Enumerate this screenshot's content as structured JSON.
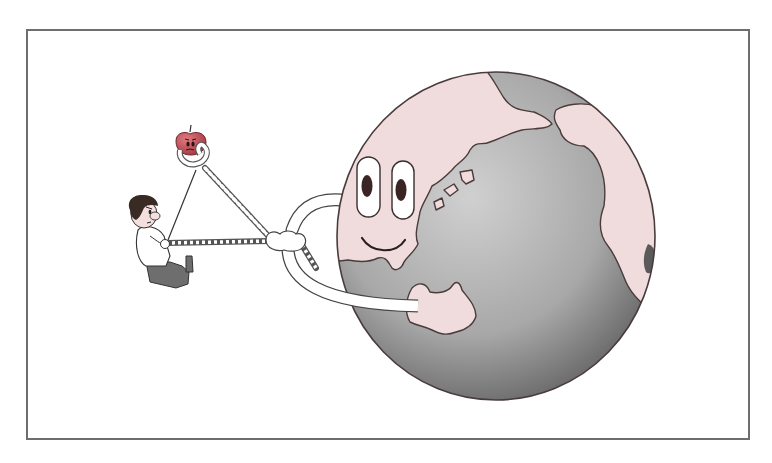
{
  "illustration": {
    "description": "Cartoon: a smiling Earth pulls a rope tied to an apple while a small boy pulls the other end",
    "characters": {
      "earth": {
        "expression": "smile",
        "pink_land": "#f0dcdc",
        "ocean_light": "#c4c4c4",
        "ocean_dark": "#7a7a7a",
        "outline": "#4a3c3c"
      },
      "boy": {
        "hair": "#3a2a24",
        "shirt": "#ffffff",
        "pants": "#6a6a6a"
      },
      "apple": {
        "color": "#b8434c",
        "expression": "frown"
      }
    },
    "frame_color": "#6e6e6e"
  }
}
